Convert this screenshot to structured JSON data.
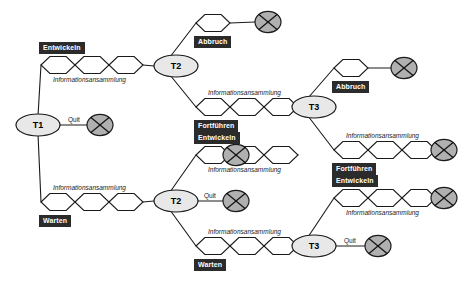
{
  "diagram": {
    "type": "decision-tree",
    "title": "",
    "colors": {
      "label_box_bg": "#2b2b2b",
      "label_box_text": "#ffffff",
      "node_fill": "#e8e8e8",
      "terminal_fill": "#b0b0b0",
      "stroke": "#1a1a1a",
      "background": "#ffffff"
    },
    "decision_nodes": [
      {
        "id": "t1",
        "label": "T1",
        "x": 38,
        "y": 125
      },
      {
        "id": "t2a",
        "label": "T2",
        "x": 176,
        "y": 66
      },
      {
        "id": "t2b",
        "label": "T2",
        "x": 176,
        "y": 201
      },
      {
        "id": "t3a",
        "label": "T3",
        "x": 314,
        "y": 107
      },
      {
        "id": "t3b",
        "label": "T3",
        "x": 314,
        "y": 246
      }
    ],
    "terminal_nodes": [
      {
        "id": "x1",
        "x": 268,
        "y": 22
      },
      {
        "id": "x2",
        "x": 100,
        "y": 125
      },
      {
        "id": "x3",
        "x": 236,
        "y": 155
      },
      {
        "id": "x4",
        "x": 236,
        "y": 201
      },
      {
        "id": "x5",
        "x": 404,
        "y": 68
      },
      {
        "id": "x6",
        "x": 444,
        "y": 150
      },
      {
        "id": "x7",
        "x": 444,
        "y": 198
      },
      {
        "id": "x8",
        "x": 378,
        "y": 246
      }
    ],
    "chains": [
      {
        "id": "c1",
        "x": 41,
        "y": 65,
        "count": 3,
        "label": "Informationsansammlung",
        "label_pos": "below",
        "box_label": "Entwickeln",
        "box_pos": "above-left"
      },
      {
        "id": "c2",
        "x": 196,
        "y": 23,
        "count": 1,
        "label": "",
        "label_pos": "below",
        "box_label": "Abbruch",
        "box_pos": "below-left"
      },
      {
        "id": "c3",
        "x": 196,
        "y": 107,
        "count": 3,
        "label": "Informationsansammlung",
        "label_pos": "above",
        "box_label": "Fortführen",
        "box_pos": "below-left"
      },
      {
        "id": "c4",
        "x": 196,
        "y": 155,
        "count": 3,
        "label": "Informationsansammlung",
        "label_pos": "below",
        "box_label": "Entwickeln",
        "box_pos": "above-left"
      },
      {
        "id": "c5",
        "x": 41,
        "y": 202,
        "count": 3,
        "label": "Informationsansammlung",
        "label_pos": "above",
        "box_label": "Warten",
        "box_pos": "below-left"
      },
      {
        "id": "c6",
        "x": 196,
        "y": 246,
        "count": 3,
        "label": "Informationsansammlung",
        "label_pos": "above",
        "box_label": "Warten",
        "box_pos": "below-left"
      },
      {
        "id": "c7",
        "x": 334,
        "y": 68,
        "count": 1,
        "label": "",
        "label_pos": "below",
        "box_label": "Abbruch",
        "box_pos": "below-left"
      },
      {
        "id": "c8",
        "x": 334,
        "y": 150,
        "count": 3,
        "label": "Informationsansammlung",
        "label_pos": "above",
        "box_label": "Fortführen",
        "box_pos": "below-left"
      },
      {
        "id": "c9",
        "x": 334,
        "y": 198,
        "count": 3,
        "label": "Informationsansammlung",
        "label_pos": "below",
        "box_label": "Entwickeln",
        "box_pos": "above-left"
      }
    ],
    "branch_labels": [
      {
        "id": "q1",
        "text": "Quit",
        "x": 68,
        "y": 116
      },
      {
        "id": "q2",
        "text": "Quit",
        "x": 204,
        "y": 192
      },
      {
        "id": "q3",
        "text": "Quit",
        "x": 344,
        "y": 237
      }
    ],
    "edge_label_text": "Informationsansammlung",
    "box_labels": {
      "entwickeln": "Entwickeln",
      "warten": "Warten",
      "abbruch": "Abbruch",
      "fortfuehren": "Fortführen"
    }
  }
}
